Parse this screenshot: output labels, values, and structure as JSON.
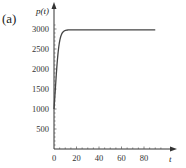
{
  "panel_label": "(a)",
  "chart_data": {
    "type": "line",
    "title": "",
    "xlabel": "t",
    "ylabel": "p(t)",
    "xlim": [
      0,
      95
    ],
    "ylim": [
      0,
      3200
    ],
    "x_ticks": [
      "0",
      "20",
      "40",
      "60",
      "80"
    ],
    "y_ticks": [
      "500",
      "1000",
      "1500",
      "2000",
      "2500",
      "3000"
    ],
    "grid": false,
    "series": [
      {
        "name": "p(t)",
        "x": [
          0,
          1,
          2,
          4,
          8,
          15,
          30,
          60,
          90
        ],
        "y": [
          1000,
          1600,
          2100,
          2500,
          2750,
          2850,
          2910,
          2950,
          2970
        ]
      }
    ]
  }
}
